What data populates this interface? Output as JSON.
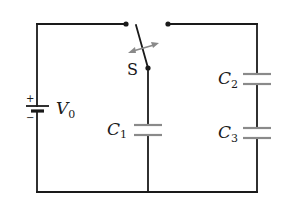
{
  "diagram": {
    "type": "circuit",
    "components": {
      "battery": {
        "label": "V",
        "subscript": "0",
        "plus": "+",
        "minus": "−"
      },
      "switch": {
        "label": "S",
        "state": "open"
      },
      "c1": {
        "label": "C",
        "subscript": "1"
      },
      "c2": {
        "label": "C",
        "subscript": "2"
      },
      "c3": {
        "label": "C",
        "subscript": "3"
      }
    },
    "colors": {
      "wire": "#1a1a1a",
      "plate": "#8a8a8a",
      "arrow": "#8a8a8a",
      "background": "#ffffff"
    }
  }
}
